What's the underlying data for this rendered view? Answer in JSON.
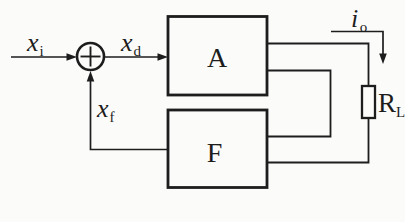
{
  "colors": {
    "background": "#fbfbfa",
    "line": "#1d1d1d"
  },
  "blocks": {
    "amplifier": "A",
    "feedback_network": "F"
  },
  "signals": {
    "input": {
      "base": "x",
      "sub": "i"
    },
    "difference": {
      "base": "x",
      "sub": "d"
    },
    "feedback": {
      "base": "x",
      "sub": "f"
    },
    "output_current": {
      "base": "i",
      "sub": "o"
    }
  },
  "components": {
    "load_resistor": {
      "base": "R",
      "sub": "L"
    }
  },
  "icons": {
    "summing_junction": "+"
  }
}
